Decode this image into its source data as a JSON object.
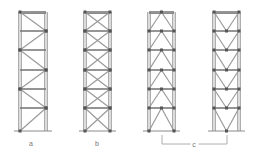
{
  "figure": {
    "type": "braced-frame-comparison",
    "frames": [
      {
        "id": "a",
        "label": "a",
        "bracing": "single-diagonal-zigzag",
        "x_left": 20,
        "x_right": 46
      },
      {
        "id": "b",
        "label": "b",
        "bracing": "x-bracing",
        "x_left": 85,
        "x_right": 110
      },
      {
        "id": "c1",
        "label": "",
        "bracing": "chevron-inverted-v",
        "x_left": 149,
        "x_right": 174
      },
      {
        "id": "c2",
        "label": "",
        "bracing": "v-bracing",
        "x_left": 214,
        "x_right": 239
      }
    ],
    "levels_y": [
      12,
      31,
      50,
      70,
      89,
      108,
      131
    ],
    "group_bracket": {
      "label": "c",
      "x_start": 162,
      "x_end": 227,
      "y": 144
    },
    "colors": {
      "line": "#8a8a8a",
      "node": "#555555",
      "label": "#777777"
    }
  }
}
